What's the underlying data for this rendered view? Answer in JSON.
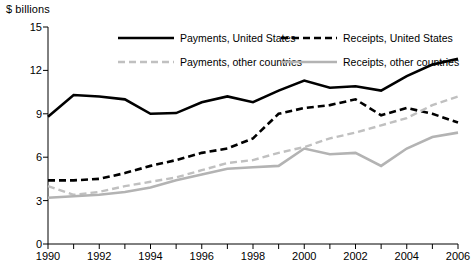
{
  "chart_data": {
    "type": "line",
    "title": "",
    "subtitle": "",
    "unit_label": "$ billions",
    "xlabel": "",
    "ylabel": "$ billions",
    "xlim": [
      1990,
      2006
    ],
    "ylim": [
      0,
      15
    ],
    "yticks": [
      0,
      3,
      6,
      9,
      12,
      15
    ],
    "ytick_labels": [
      "0",
      "3",
      "6",
      "9",
      "12",
      "15"
    ],
    "xticks": [
      1990,
      1991,
      1992,
      1993,
      1994,
      1995,
      1996,
      1997,
      1998,
      1999,
      2000,
      2001,
      2002,
      2003,
      2004,
      2005,
      2006
    ],
    "xtick_labels_shown": [
      "1990",
      "1992",
      "1994",
      "1996",
      "1998",
      "2000",
      "2002",
      "2004",
      "2006"
    ],
    "grid": false,
    "legend_position": "top-inside",
    "x": [
      1990,
      1991,
      1992,
      1993,
      1994,
      1995,
      1996,
      1997,
      1998,
      1999,
      2000,
      2001,
      2002,
      2003,
      2004,
      2005,
      2006
    ],
    "series": [
      {
        "name": "Payments, United States",
        "style": "solid",
        "color": "#000000",
        "width": 2.6,
        "values": [
          8.8,
          10.3,
          10.2,
          10.0,
          9.0,
          9.05,
          9.8,
          10.2,
          9.8,
          10.6,
          11.3,
          10.8,
          10.9,
          10.6,
          11.6,
          12.4,
          12.8
        ]
      },
      {
        "name": "Receipts, United States",
        "style": "dashed",
        "color": "#000000",
        "width": 2.6,
        "values": [
          4.4,
          4.4,
          4.5,
          4.9,
          5.4,
          5.8,
          6.3,
          6.6,
          7.3,
          9.0,
          9.4,
          9.6,
          10.0,
          8.9,
          9.4,
          9.0,
          8.4
        ]
      },
      {
        "name": "Payments, other countries",
        "style": "dashed",
        "color": "#c0c0c0",
        "width": 2.4,
        "values": [
          4.0,
          3.4,
          3.6,
          4.0,
          4.3,
          4.6,
          5.1,
          5.6,
          5.8,
          6.3,
          6.7,
          7.3,
          7.7,
          8.2,
          8.7,
          9.6,
          10.2
        ]
      },
      {
        "name": "Receipts, other countries",
        "style": "solid",
        "color": "#b3b3b3",
        "width": 2.6,
        "values": [
          3.2,
          3.3,
          3.4,
          3.6,
          3.9,
          4.4,
          4.8,
          5.2,
          5.3,
          5.4,
          6.6,
          6.2,
          6.3,
          5.4,
          6.6,
          7.4,
          7.7
        ]
      }
    ]
  },
  "legend": {
    "entries": [
      {
        "label": "Payments, United States",
        "marker": "solid-black-line"
      },
      {
        "label": "Receipts, United States",
        "marker": "dashed-black-line"
      },
      {
        "label": "Payments, other countries",
        "marker": "dashed-grey-line"
      },
      {
        "label": "Receipts, other countries",
        "marker": "solid-grey-line"
      }
    ]
  },
  "axes": {
    "unit_label": "$ billions",
    "axis_color": "#000000"
  }
}
